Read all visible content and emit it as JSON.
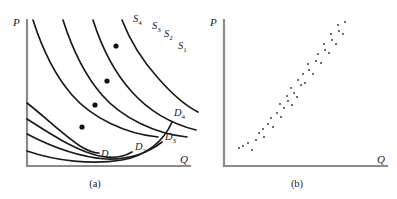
{
  "figure": {
    "background": "#ffffff",
    "curve_color": "#1b1b1b",
    "axis_color": "#8b8b8b",
    "dot_color": "#111111"
  },
  "panel_a": {
    "caption": "(a)",
    "y_axis_label": "P",
    "x_axis_label": "Q",
    "supply_labels": [
      {
        "base": "S",
        "sub": "1",
        "x": 180,
        "y": 47
      },
      {
        "base": "S",
        "sub": "2",
        "x": 167,
        "y": 35
      },
      {
        "base": "S",
        "sub": "3",
        "x": 155,
        "y": 28
      },
      {
        "base": "S",
        "sub": "4",
        "x": 137,
        "y": 20
      }
    ],
    "demand_labels": [
      {
        "base": "D",
        "sub": "1",
        "x": 104,
        "y": 154
      },
      {
        "base": "D",
        "sub": "2",
        "x": 139,
        "y": 145
      },
      {
        "base": "D",
        "sub": "3",
        "x": 168,
        "y": 135
      },
      {
        "base": "D",
        "sub": "4",
        "x": 175,
        "y": 113
      }
    ],
    "equilibrium_points": [
      {
        "x": 116,
        "y": 46
      },
      {
        "x": 107,
        "y": 81
      },
      {
        "x": 95,
        "y": 105
      },
      {
        "x": 82,
        "y": 127
      }
    ]
  },
  "panel_b": {
    "caption": "(b)",
    "y_axis_label": "P",
    "x_axis_label": "Q"
  },
  "chart_data": [
    {
      "type": "line",
      "title": "(a)",
      "xlabel": "Q",
      "ylabel": "P",
      "description": "Shifting supply and demand curves tracing out equilibrium points",
      "grid": false,
      "legend": "inline curve labels",
      "series": [
        {
          "name": "S1",
          "kind": "supply",
          "points": [
            [
              33,
              20
            ],
            [
              48,
              50
            ],
            [
              64,
              79
            ],
            [
              86,
              104
            ],
            [
              118,
              124
            ],
            [
              160,
              136
            ]
          ]
        },
        {
          "name": "S2",
          "kind": "supply",
          "points": [
            [
              63,
              20
            ],
            [
              78,
              50
            ],
            [
              94,
              79
            ],
            [
              116,
              104
            ],
            [
              148,
              124
            ],
            [
              188,
              136
            ]
          ]
        },
        {
          "name": "S3",
          "kind": "supply",
          "points": [
            [
              93,
              20
            ],
            [
              108,
              50
            ],
            [
              124,
              79
            ],
            [
              146,
              104
            ],
            [
              176,
              124
            ],
            [
              196,
              130
            ]
          ]
        },
        {
          "name": "S4",
          "kind": "supply",
          "points": [
            [
              122,
              20
            ],
            [
              134,
              42
            ],
            [
              148,
              65
            ],
            [
              166,
              88
            ],
            [
              186,
              106
            ],
            [
              196,
              112
            ]
          ]
        },
        {
          "name": "D1",
          "kind": "demand",
          "points": [
            [
              27,
              105
            ],
            [
              44,
              120
            ],
            [
              62,
              136
            ],
            [
              84,
              148
            ],
            [
              100,
              152
            ]
          ]
        },
        {
          "name": "D2",
          "kind": "demand",
          "points": [
            [
              27,
              120
            ],
            [
              48,
              136
            ],
            [
              74,
              150
            ],
            [
              105,
              157
            ],
            [
              134,
              147
            ]
          ]
        },
        {
          "name": "D3",
          "kind": "demand",
          "points": [
            [
              27,
              135
            ],
            [
              52,
              149
            ],
            [
              84,
              158
            ],
            [
              120,
              155
            ],
            [
              160,
              140
            ]
          ]
        },
        {
          "name": "D4",
          "kind": "demand",
          "points": [
            [
              27,
              152
            ],
            [
              58,
              162
            ],
            [
              96,
              164
            ],
            [
              134,
              155
            ],
            [
              170,
              120
            ]
          ]
        }
      ],
      "equilibria": [
        [
          116,
          46
        ],
        [
          107,
          81
        ],
        [
          95,
          105
        ],
        [
          82,
          127
        ]
      ]
    },
    {
      "type": "scatter",
      "title": "(b)",
      "xlabel": "Q",
      "ylabel": "P",
      "description": "Observed price-quantity pairs scattered along an upward-sloping cloud",
      "grid": false,
      "points": [
        [
          46,
          146
        ],
        [
          51,
          143
        ],
        [
          55,
          150
        ],
        [
          59,
          140
        ],
        [
          42,
          148
        ],
        [
          62,
          133
        ],
        [
          67,
          137
        ],
        [
          66,
          129
        ],
        [
          71,
          124
        ],
        [
          76,
          127
        ],
        [
          74,
          118
        ],
        [
          80,
          113
        ],
        [
          84,
          117
        ],
        [
          87,
          108
        ],
        [
          83,
          104
        ],
        [
          91,
          101
        ],
        [
          95,
          105
        ],
        [
          90,
          96
        ],
        [
          97,
          93
        ],
        [
          100,
          97
        ],
        [
          94,
          88
        ],
        [
          104,
          85
        ],
        [
          101,
          80
        ],
        [
          108,
          83
        ],
        [
          106,
          74
        ],
        [
          112,
          70
        ],
        [
          116,
          74
        ],
        [
          111,
          64
        ],
        [
          119,
          61
        ],
        [
          124,
          63
        ],
        [
          121,
          54
        ],
        [
          128,
          50
        ],
        [
          132,
          53
        ],
        [
          127,
          44
        ],
        [
          135,
          40
        ],
        [
          139,
          44
        ],
        [
          134,
          34
        ],
        [
          142,
          31
        ],
        [
          146,
          34
        ],
        [
          141,
          25
        ],
        [
          148,
          22
        ]
      ],
      "xlim": [
        0,
        200
      ],
      "ylim": [
        0,
        170
      ]
    }
  ]
}
